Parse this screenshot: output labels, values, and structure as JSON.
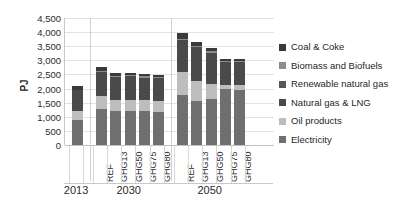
{
  "chart_data": {
    "type": "bar",
    "stacked": true,
    "title": "",
    "subtitle": "",
    "xlabel": "",
    "ylabel": "PJ",
    "ylim": [
      0,
      4500
    ],
    "ytick_labels": [
      "4,500",
      "4,000",
      "3,500",
      "3,000",
      "2,500",
      "2,000",
      "1,500",
      "1,000",
      "500",
      "0"
    ],
    "ytick_values": [
      4500,
      4000,
      3500,
      3000,
      2500,
      2000,
      1500,
      1000,
      500,
      0
    ],
    "grid": true,
    "legend_position": "right",
    "groups": [
      {
        "label": "2013",
        "categories": [
          " "
        ]
      },
      {
        "label": "2030",
        "categories": [
          "REF",
          "GHG13",
          "GHG50",
          "GHG75",
          "GHG80"
        ]
      },
      {
        "label": "2050",
        "categories": [
          "REF",
          "GHG13",
          "GHG50",
          "GHG75",
          "GHG80"
        ]
      }
    ],
    "categories": [
      "2013",
      "2030 REF",
      "2030 GHG13",
      "2030 GHG50",
      "2030 GHG75",
      "2030 GHG80",
      "2050 REF",
      "2050 GHG13",
      "2050 GHG50",
      "2050 GHG75",
      "2050 GHG80"
    ],
    "series": [
      {
        "name": "Coal & Coke",
        "color": "#3a3a3a",
        "values": [
          120,
          130,
          95,
          90,
          85,
          80,
          200,
          115,
          115,
          65,
          60
        ]
      },
      {
        "name": "Biomass and Biofuels",
        "color": "#8d8d8d",
        "values": [
          20,
          30,
          40,
          40,
          45,
          45,
          40,
          60,
          60,
          55,
          55
        ]
      },
      {
        "name": "Renewable natural gas",
        "color": "#555555",
        "values": [
          0,
          0,
          0,
          0,
          0,
          0,
          0,
          0,
          0,
          0,
          0
        ]
      },
      {
        "name": "Natural gas & LNG",
        "color": "#4a4a4a",
        "values": [
          750,
          870,
          800,
          820,
          800,
          790,
          1120,
          1190,
          1090,
          800,
          790
        ]
      },
      {
        "name": "Oil products",
        "color": "#bdbdbd",
        "values": [
          320,
          450,
          400,
          410,
          400,
          400,
          830,
          700,
          530,
          170,
          170
        ]
      },
      {
        "name": "Electricity",
        "color": "#6f6f6f",
        "values": [
          870,
          1280,
          1205,
          1200,
          1190,
          1175,
          1770,
          1575,
          1645,
          1970,
          1965
        ]
      }
    ],
    "totals": [
      2080,
      2760,
      2540,
      2560,
      2520,
      2490,
      3960,
      3640,
      3440,
      3060,
      3040
    ]
  },
  "legend": {
    "items": [
      {
        "label": "Coal & Coke",
        "swatch": "legend-swatch-coal-coke"
      },
      {
        "label": "Biomass and Biofuels",
        "swatch": "legend-swatch-biomass-biofuels"
      },
      {
        "label": "Renewable natural gas",
        "swatch": "legend-swatch-renewable-natural-gas"
      },
      {
        "label": "Natural gas & LNG",
        "swatch": "legend-swatch-natural-gas-lng"
      },
      {
        "label": "Oil products",
        "swatch": "legend-swatch-oil-products"
      },
      {
        "label": "Electricity",
        "swatch": "legend-swatch-electricity"
      }
    ]
  },
  "colors": {
    "coal_coke": "#3a3a3a",
    "biomass_biofuels": "#8d8d8d",
    "renewable_natural_gas": "#555555",
    "natural_gas_lng": "#4a4a4a",
    "oil_products": "#bdbdbd",
    "electricity": "#6f6f6f",
    "gridline": "#e2e2e2",
    "axis": "#c9c9c9",
    "text": "#2b2b2b",
    "background": "#ffffff"
  }
}
